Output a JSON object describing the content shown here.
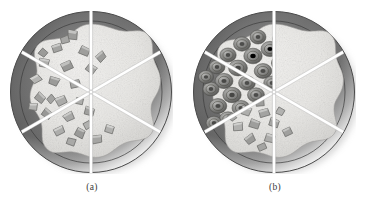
{
  "figure": {
    "type": "scientific-illustration",
    "background_color": "#ffffff",
    "panel_count": 2
  },
  "panels": [
    {
      "id": "a",
      "caption": "(a)",
      "dish": {
        "shape": "circle",
        "sector_count": 6,
        "divider_color": "#ffffff",
        "rim_color_dark": "#4a4a4a",
        "rim_color_light": "#d8d8d8",
        "surface_color": "#e8e7e4",
        "outline_color": "#5b5b5b"
      },
      "sectors": [
        {
          "index": 0,
          "position": "top-left",
          "fill": "angular-particles"
        },
        {
          "index": 1,
          "position": "left",
          "fill": "angular-particles"
        },
        {
          "index": 2,
          "position": "bottom-left",
          "fill": "angular-particles"
        },
        {
          "index": 3,
          "position": "bottom-right",
          "fill": "plain-speckle"
        },
        {
          "index": 4,
          "position": "right",
          "fill": "plain-speckle"
        },
        {
          "index": 5,
          "position": "top-right",
          "fill": "plain-speckle"
        }
      ],
      "particle": {
        "style": "angular",
        "label": "angular blocky aggregate particles",
        "fill_color": "#a9a9a7",
        "edge_color": "#6e6e6c",
        "count": 26
      }
    },
    {
      "id": "b",
      "caption": "(b)",
      "dish": {
        "shape": "circle",
        "sector_count": 6,
        "divider_color": "#ffffff",
        "rim_color_dark": "#4a4a4a",
        "rim_color_light": "#d8d8d8",
        "surface_color": "#e8e7e4",
        "outline_color": "#5b5b5b"
      },
      "sectors": [
        {
          "index": 0,
          "position": "top-left",
          "fill": "rounded-particles"
        },
        {
          "index": 1,
          "position": "left",
          "fill": "rounded-particles"
        },
        {
          "index": 2,
          "position": "bottom-left",
          "fill": "angular-particles"
        },
        {
          "index": 3,
          "position": "bottom-right",
          "fill": "plain-speckle"
        },
        {
          "index": 4,
          "position": "right",
          "fill": "plain-speckle"
        },
        {
          "index": 5,
          "position": "top-right",
          "fill": "plain-speckle"
        }
      ],
      "particle": {
        "style": "rounded-concentric",
        "label": "rounded coated aggregate particles with concentric rings",
        "fill_color": "#8e8e8c",
        "edge_color": "#5a5a58",
        "count": 34
      }
    }
  ],
  "geometry": {
    "dish_center_x": 82,
    "dish_center_y": 81,
    "dish_outer_radius": 81,
    "dish_inner_radius": 68,
    "divider_angles_deg": [
      90,
      150,
      210,
      270,
      330,
      30
    ]
  }
}
